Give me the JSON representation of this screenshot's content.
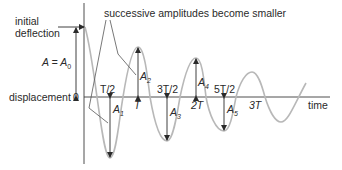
{
  "diagram": {
    "title_annotation": "successive amplitudes become smaller",
    "initial_deflection": [
      "initial",
      "deflection"
    ],
    "a_equals": "A = A",
    "a_equals_sub": "0",
    "y_axis_label": "displacement",
    "origin_label": "0",
    "x_axis_label": "time",
    "ticks": [
      {
        "label": "T/2",
        "italic": false
      },
      {
        "label": "T",
        "italic": true
      },
      {
        "label": "3T/2",
        "italic": false
      },
      {
        "label": "2T",
        "italic": true
      },
      {
        "label": "5T/2",
        "italic": false
      },
      {
        "label": "3T",
        "italic": true
      }
    ],
    "amplitudes": [
      {
        "base": "A",
        "sub": "1"
      },
      {
        "base": "A",
        "sub": "2"
      },
      {
        "base": "A",
        "sub": "3"
      },
      {
        "base": "A",
        "sub": "4"
      },
      {
        "base": "A",
        "sub": "5"
      }
    ],
    "colors": {
      "wave": "#b8b8b8",
      "axis": "#3a3a3a",
      "text": "#2a2a2a"
    }
  }
}
